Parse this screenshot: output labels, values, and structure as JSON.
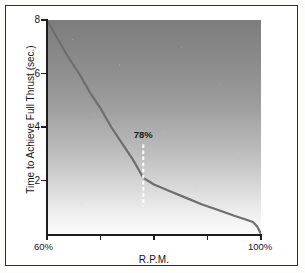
{
  "chart_data": {
    "type": "line",
    "title": "",
    "xlabel": "R.P.M.",
    "ylabel": "Time to Achieve Full Thrust (sec.)",
    "xlim": [
      60,
      100
    ],
    "ylim": [
      0,
      8
    ],
    "grid": false,
    "legend": "none",
    "x_tick_labels": [
      "60%",
      "",
      "",
      "",
      "100%"
    ],
    "x_tick_values": [
      60,
      70,
      80,
      90,
      100
    ],
    "y_tick_labels": [
      "2",
      "4",
      "6",
      "8"
    ],
    "y_tick_values": [
      2,
      4,
      6,
      8
    ],
    "series": [
      {
        "name": "Time to Achieve Full Thrust",
        "x": [
          60,
          62,
          64,
          66,
          68,
          70,
          72,
          74,
          76,
          78,
          80,
          83,
          86,
          89,
          92,
          95,
          97,
          98.5,
          99.3,
          100
        ],
        "values": [
          8.0,
          7.3,
          6.6,
          6.0,
          5.3,
          4.7,
          4.0,
          3.4,
          2.8,
          2.1,
          1.85,
          1.6,
          1.35,
          1.1,
          0.9,
          0.68,
          0.55,
          0.45,
          0.28,
          0.0
        ]
      }
    ],
    "annotations": [
      {
        "label": "78%",
        "x": 78,
        "y": 2.1,
        "marker": "dashed-vertical-line",
        "color": "#ffffff"
      }
    ],
    "style": {
      "plot_background": "vertical-gradient-dark-to-light",
      "plot_bg_top": "#7d7d7d",
      "plot_bg_bottom": "#fbfbfb",
      "line_color": "#6e6e6e",
      "axis_color": "#1d1d1d",
      "text_color": "#161616",
      "frame_color": "#2e2e2e"
    }
  }
}
